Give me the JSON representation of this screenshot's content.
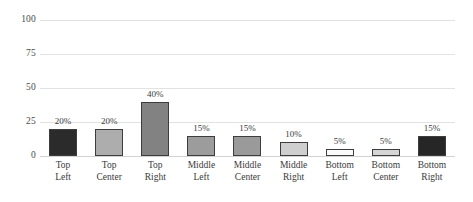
{
  "chart_data": {
    "type": "bar",
    "title": "",
    "subtitle": "",
    "xlabel": "",
    "ylabel": "",
    "ylim": [
      0,
      100
    ],
    "yticks": [
      0,
      25,
      50,
      75,
      100
    ],
    "ytick_labels": [
      "0",
      "25",
      "50",
      "75",
      "100"
    ],
    "grid": true,
    "legend": "none",
    "categories": [
      "Top Left",
      "Top Center",
      "Top Right",
      "Middle Left",
      "Middle Center",
      "Middle Right",
      "Bottom Left",
      "Bottom Center",
      "Bottom Right"
    ],
    "category_lines": [
      [
        "Top",
        "Left"
      ],
      [
        "Top",
        "Center"
      ],
      [
        "Top",
        "Right"
      ],
      [
        "Middle",
        "Left"
      ],
      [
        "Middle",
        "Center"
      ],
      [
        "Middle",
        "Right"
      ],
      [
        "Bottom",
        "Left"
      ],
      [
        "Bottom",
        "Center"
      ],
      [
        "Bottom",
        "Right"
      ]
    ],
    "values": [
      20,
      20,
      40,
      15,
      15,
      10,
      5,
      5,
      15
    ],
    "data_labels": [
      "20%",
      "20%",
      "40%",
      "15%",
      "15%",
      "10%",
      "5%",
      "5%",
      "15%"
    ],
    "bar_colors": [
      "#2b2b2b",
      "#adadad",
      "#828282",
      "#9c9c9c",
      "#9a9a9a",
      "#cfcfcf",
      "#fbfbfb",
      "#d5d5d5",
      "#262626"
    ],
    "bar_border_color": "#3d3d3d",
    "gridline_color": "#e2e2e2",
    "background_color": "#ffffff",
    "text_color": "#3a3a3a"
  }
}
